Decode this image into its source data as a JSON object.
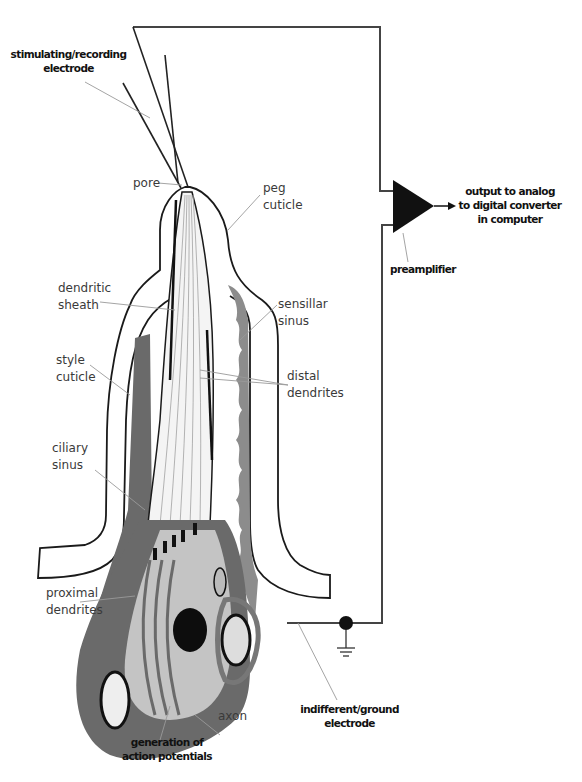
{
  "diagram": {
    "labels": {
      "stimulating_electrode": [
        "stimulating/recording",
        "electrode"
      ],
      "pore": [
        "pore"
      ],
      "peg_cuticle": [
        "peg",
        "cuticle"
      ],
      "dendritic_sheath": [
        "dendritic",
        "sheath"
      ],
      "sensillar_sinus": [
        "sensillar",
        "sinus"
      ],
      "style_cuticle": [
        "style",
        "cuticle"
      ],
      "distal_dendrites": [
        "distal",
        "dendrites"
      ],
      "ciliary_sinus": [
        "ciliary",
        "sinus"
      ],
      "proximal_dendrites": [
        "proximal",
        "dendrites"
      ],
      "axon": [
        "axon"
      ],
      "generation": [
        "generation of",
        "action potentials"
      ],
      "indifferent_electrode": [
        "indifferent/ground",
        "electrode"
      ],
      "preamplifier": [
        "preamplifier"
      ],
      "output": [
        "output to analog",
        "to digital converter",
        "in computer"
      ]
    },
    "components": {
      "amplifier_icon": "triangle-amplifier",
      "ground_icon": "ground-symbol",
      "junction_icon": "filled-circle-node"
    },
    "colors": {
      "line": "#1a1a1a",
      "dark_fill": "#5e5e5e",
      "mid_fill": "#8a8a8a",
      "light_fill": "#c4c4c4",
      "leader": "#9a9a9a"
    }
  }
}
